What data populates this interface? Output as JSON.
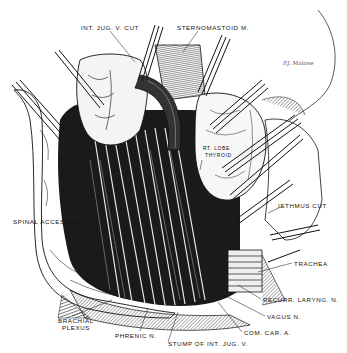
{
  "figure": {
    "type": "anatomical-illustration",
    "signature": "P.J. Malone"
  },
  "labels": [
    {
      "id": "int-jug-v-cut",
      "text": "INT. JUG. V. CUT",
      "x": 81,
      "y": 25
    },
    {
      "id": "sternomastoid-m",
      "text": "STERNOMASTOID M.",
      "x": 177,
      "y": 25
    },
    {
      "id": "rt-lobe-thyroid-1",
      "text": "RT. LOBE",
      "x": 203,
      "y": 147
    },
    {
      "id": "rt-lobe-thyroid-2",
      "text": "THYROID",
      "x": 205,
      "y": 154
    },
    {
      "id": "isthmus-cut",
      "text": "ISTHMUS CUT",
      "x": 278,
      "y": 203
    },
    {
      "id": "spinal-access-n",
      "text": "SPINAL ACCESS N.",
      "x": 13,
      "y": 219
    },
    {
      "id": "trachea",
      "text": "TRACHEA",
      "x": 294,
      "y": 261
    },
    {
      "id": "recurr-laryng-n",
      "text": "RECURR. LARYNG. N.",
      "x": 263,
      "y": 297
    },
    {
      "id": "brachial-plexus-1",
      "text": "BRACHIAL",
      "x": 58,
      "y": 318
    },
    {
      "id": "brachial-plexus-2",
      "text": "PLEXUS",
      "x": 62,
      "y": 325
    },
    {
      "id": "vagus-n",
      "text": "VAGUS N.",
      "x": 267,
      "y": 314
    },
    {
      "id": "phrenic-n",
      "text": "PHRENIC N.",
      "x": 115,
      "y": 333
    },
    {
      "id": "com-car-a",
      "text": "COM. CAR. A.",
      "x": 244,
      "y": 330
    },
    {
      "id": "stump-of-int-jug-v",
      "text": "STUMP OF INT. JUG. V.",
      "x": 168,
      "y": 341
    }
  ],
  "colors": {
    "ink": "#111111",
    "background": "#ffffff",
    "shade": "#444444"
  }
}
